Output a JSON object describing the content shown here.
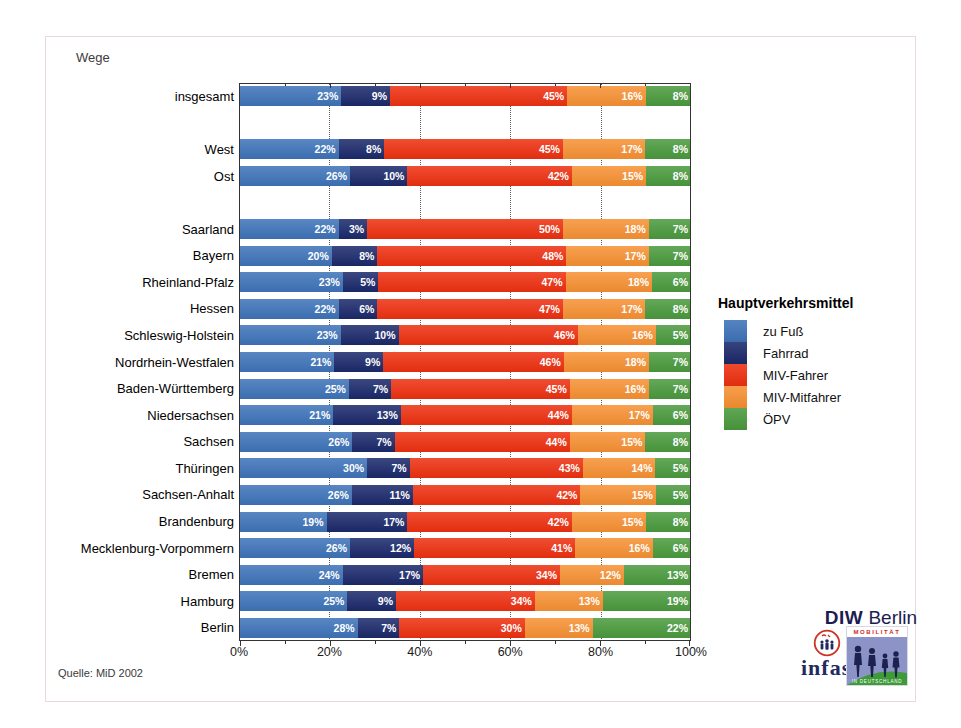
{
  "title": "Wege",
  "source": "Quelle: MiD 2002",
  "legend": {
    "title": "Hauptverkehrsmittel"
  },
  "logos": {
    "diw_bold": "DIW",
    "diw_rest": "Berlin",
    "infas": "infas",
    "mobilitaet_top": "MOBILITÄT",
    "mobilitaet_bottom": "IN DEUTSCHLAND"
  },
  "chart_data": {
    "type": "bar",
    "stacked": true,
    "orientation": "horizontal",
    "unit": "%",
    "xlim": [
      0,
      100
    ],
    "x_tick_labels": [
      "0%",
      "20%",
      "40%",
      "60%",
      "80%",
      "100%"
    ],
    "x_major_ticks": [
      0,
      20,
      40,
      60,
      80,
      100
    ],
    "x_minor_ticks": [
      10,
      30,
      50,
      70,
      90
    ],
    "gridlines": [
      20,
      40,
      60,
      80
    ],
    "grid_style": "dotted",
    "legend_position": "right",
    "series": [
      {
        "name": "zu Fuß",
        "color": "#3E73B9"
      },
      {
        "name": "Fahrrad",
        "color": "#1B296B"
      },
      {
        "name": "MIV-Fahrer",
        "color": "#EE3010"
      },
      {
        "name": "MIV-Mitfahrer",
        "color": "#F79133"
      },
      {
        "name": "ÖPV",
        "color": "#4A9A3D"
      }
    ],
    "gap_after_rows": [
      0,
      2
    ],
    "rows": [
      {
        "category": "insgesamt",
        "values": [
          23,
          9,
          45,
          16,
          8
        ]
      },
      {
        "category": "West",
        "values": [
          22,
          8,
          45,
          17,
          8
        ]
      },
      {
        "category": "Ost",
        "values": [
          26,
          10,
          42,
          15,
          8
        ]
      },
      {
        "category": "Saarland",
        "values": [
          22,
          3,
          50,
          18,
          7
        ]
      },
      {
        "category": "Bayern",
        "values": [
          20,
          8,
          48,
          17,
          7
        ]
      },
      {
        "category": "Rheinland-Pfalz",
        "values": [
          23,
          5,
          47,
          18,
          6
        ]
      },
      {
        "category": "Hessen",
        "values": [
          22,
          6,
          47,
          17,
          8
        ]
      },
      {
        "category": "Schleswig-Holstein",
        "values": [
          23,
          10,
          46,
          16,
          5
        ]
      },
      {
        "category": "Nordrhein-Westfalen",
        "values": [
          21,
          9,
          46,
          18,
          7
        ]
      },
      {
        "category": "Baden-Württemberg",
        "values": [
          25,
          7,
          45,
          16,
          7
        ]
      },
      {
        "category": "Niedersachsen",
        "values": [
          21,
          13,
          44,
          17,
          6
        ]
      },
      {
        "category": "Sachsen",
        "values": [
          26,
          7,
          44,
          15,
          8
        ]
      },
      {
        "category": "Thüringen",
        "values": [
          30,
          7,
          43,
          14,
          5
        ]
      },
      {
        "category": "Sachsen-Anhalt",
        "values": [
          26,
          11,
          42,
          15,
          5
        ]
      },
      {
        "category": "Brandenburg",
        "values": [
          19,
          17,
          42,
          15,
          8
        ]
      },
      {
        "category": "Mecklenburg-Vorpommern",
        "values": [
          26,
          12,
          41,
          16,
          6
        ]
      },
      {
        "category": "Bremen",
        "values": [
          24,
          17,
          34,
          12,
          13
        ]
      },
      {
        "category": "Hamburg",
        "values": [
          25,
          9,
          34,
          13,
          19
        ]
      },
      {
        "category": "Berlin",
        "values": [
          28,
          7,
          30,
          13,
          22
        ]
      }
    ]
  }
}
